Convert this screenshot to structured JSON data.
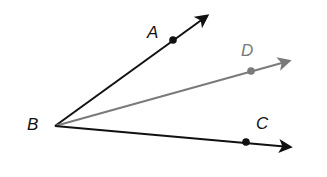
{
  "diagram": {
    "type": "angle-rays",
    "vertex": {
      "label": "B",
      "color": "#111111"
    },
    "rays": [
      {
        "id": "BA",
        "point_label": "A",
        "color": "#111111"
      },
      {
        "id": "BD",
        "point_label": "D",
        "color": "#7a7a7a"
      },
      {
        "id": "BC",
        "point_label": "C",
        "color": "#111111"
      }
    ]
  }
}
